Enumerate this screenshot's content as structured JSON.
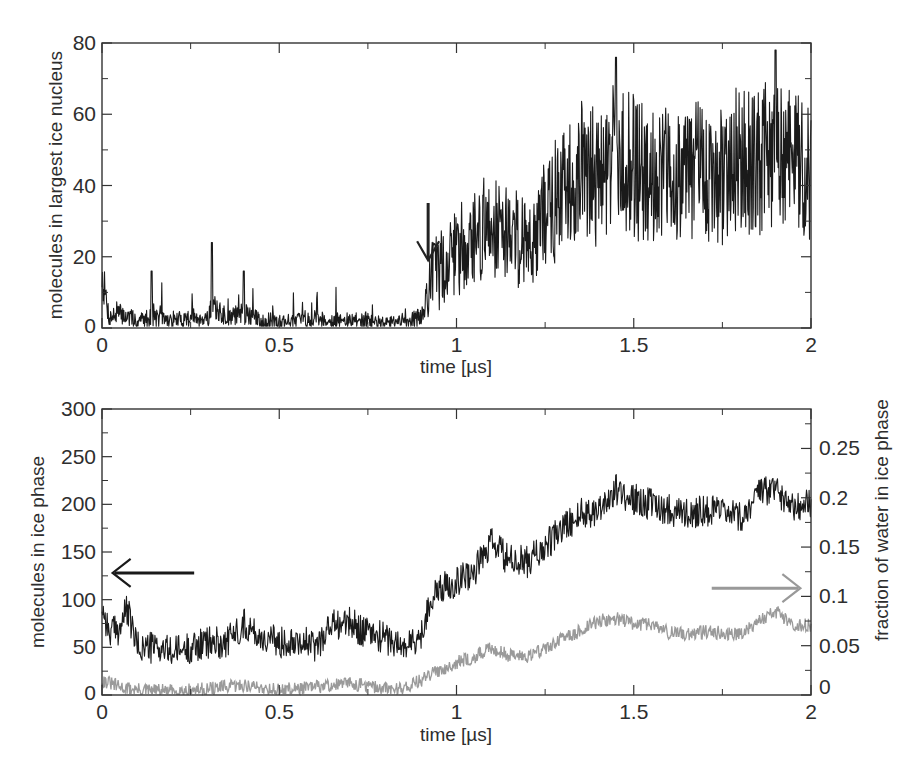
{
  "chart_data": [
    {
      "type": "line",
      "panel": "top",
      "title": "",
      "xlabel": "time [µs]",
      "ylabel": "molecules in largest ice nucleus",
      "xlim": [
        0,
        2
      ],
      "ylim": [
        0,
        80
      ],
      "x_ticks": [
        "0",
        "0.5",
        "1",
        "1.5",
        "2"
      ],
      "y_ticks": [
        "0",
        "20",
        "40",
        "60",
        "80"
      ],
      "grid": false,
      "legend": null,
      "annotations": [
        {
          "type": "arrow",
          "direction": "down",
          "x": 0.92,
          "y_tip": 19,
          "label": ""
        }
      ],
      "series": [
        {
          "name": "largest ice nucleus",
          "color": "#1a1a1a",
          "x": [
            0.0,
            0.02,
            0.05,
            0.1,
            0.14,
            0.2,
            0.25,
            0.3,
            0.31,
            0.35,
            0.4,
            0.45,
            0.5,
            0.55,
            0.6,
            0.65,
            0.7,
            0.75,
            0.8,
            0.85,
            0.9,
            0.93,
            0.95,
            1.0,
            1.05,
            1.1,
            1.15,
            1.2,
            1.25,
            1.3,
            1.35,
            1.4,
            1.45,
            1.5,
            1.55,
            1.6,
            1.65,
            1.7,
            1.75,
            1.8,
            1.85,
            1.9,
            1.95,
            2.0
          ],
          "y": [
            15,
            3,
            4,
            2,
            3,
            2,
            3,
            3,
            6,
            3,
            4,
            2,
            2,
            2,
            3,
            2,
            2,
            2,
            1,
            2,
            3,
            14,
            16,
            22,
            25,
            30,
            27,
            24,
            32,
            38,
            44,
            42,
            50,
            45,
            44,
            43,
            45,
            43,
            42,
            48,
            46,
            50,
            47,
            45
          ],
          "peaks": [
            {
              "x": 0.14,
              "y": 16
            },
            {
              "x": 0.31,
              "y": 24
            },
            {
              "x": 0.4,
              "y": 16
            },
            {
              "x": 1.45,
              "y": 76
            },
            {
              "x": 1.9,
              "y": 78
            }
          ]
        }
      ]
    },
    {
      "type": "line",
      "panel": "bottom",
      "title": "",
      "xlabel": "time [µs]",
      "ylabel": "molecules in ice phase",
      "ylabel_right": "fraction of water in ice phase",
      "xlim": [
        0,
        2
      ],
      "ylim": [
        0,
        300
      ],
      "ylim_right": [
        0,
        0.29
      ],
      "x_ticks": [
        "0",
        "0.5",
        "1",
        "1.5",
        "2"
      ],
      "y_ticks": [
        "0",
        "50",
        "100",
        "150",
        "200",
        "250",
        "300"
      ],
      "y_ticks_right": [
        "0",
        "0.05",
        "0.1",
        "0.15",
        "0.2",
        "0.25"
      ],
      "grid": false,
      "legend": null,
      "annotations": [
        {
          "type": "arrow",
          "direction": "left",
          "color": "#1a1a1a",
          "x_from": 0.26,
          "x_to": 0.03,
          "y": 128,
          "meaning": "black series uses left axis"
        },
        {
          "type": "arrow",
          "direction": "right",
          "color": "#999999",
          "x_from": 1.72,
          "x_to": 1.97,
          "y": 112,
          "meaning": "gray series uses right axis"
        }
      ],
      "series": [
        {
          "name": "molecules in ice phase",
          "axis": "left",
          "color": "#1a1a1a",
          "x": [
            0.0,
            0.02,
            0.05,
            0.07,
            0.1,
            0.15,
            0.2,
            0.25,
            0.3,
            0.35,
            0.4,
            0.45,
            0.5,
            0.55,
            0.6,
            0.65,
            0.7,
            0.75,
            0.8,
            0.85,
            0.9,
            0.92,
            0.95,
            1.0,
            1.05,
            1.1,
            1.15,
            1.2,
            1.25,
            1.3,
            1.35,
            1.4,
            1.45,
            1.5,
            1.55,
            1.6,
            1.65,
            1.7,
            1.75,
            1.8,
            1.85,
            1.9,
            1.95,
            2.0
          ],
          "y": [
            95,
            65,
            70,
            90,
            50,
            50,
            45,
            50,
            55,
            55,
            75,
            60,
            55,
            60,
            50,
            75,
            75,
            65,
            60,
            50,
            60,
            95,
            110,
            120,
            130,
            160,
            140,
            140,
            155,
            175,
            190,
            195,
            215,
            205,
            200,
            195,
            190,
            195,
            190,
            185,
            210,
            215,
            200,
            200
          ]
        },
        {
          "name": "fraction of water in ice phase",
          "axis": "right",
          "color": "#9a9a9a",
          "x": [
            0.0,
            0.05,
            0.1,
            0.2,
            0.3,
            0.4,
            0.5,
            0.6,
            0.7,
            0.8,
            0.85,
            0.9,
            0.95,
            1.0,
            1.05,
            1.1,
            1.15,
            1.2,
            1.25,
            1.3,
            1.35,
            1.4,
            1.45,
            1.5,
            1.55,
            1.6,
            1.65,
            1.7,
            1.75,
            1.8,
            1.85,
            1.9,
            1.95,
            2.0
          ],
          "y": [
            0.015,
            0.008,
            0.005,
            0.004,
            0.006,
            0.01,
            0.005,
            0.008,
            0.012,
            0.006,
            0.007,
            0.015,
            0.025,
            0.033,
            0.038,
            0.048,
            0.04,
            0.04,
            0.047,
            0.057,
            0.065,
            0.075,
            0.078,
            0.072,
            0.072,
            0.063,
            0.062,
            0.064,
            0.063,
            0.062,
            0.075,
            0.085,
            0.072,
            0.07
          ]
        }
      ]
    }
  ]
}
